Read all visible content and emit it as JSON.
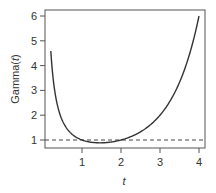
{
  "chart_data": {
    "type": "line",
    "title": "",
    "xlabel": "t",
    "ylabel": "Gamma(t)",
    "xlim": [
      0.2,
      4
    ],
    "ylim": [
      0.8,
      6.2
    ],
    "x_ticks": [
      "1",
      "2",
      "3",
      "4"
    ],
    "y_ticks": [
      "1",
      "2",
      "3",
      "4",
      "5",
      "6"
    ],
    "grid": false,
    "legend": null,
    "series": [
      {
        "name": "Gamma(t)",
        "style": "solid",
        "color": "#333333",
        "x": [
          0.2,
          0.25,
          0.3,
          0.4,
          0.5,
          0.6,
          0.7,
          0.8,
          0.9,
          1.0,
          1.2,
          1.4,
          1.46,
          1.6,
          1.8,
          2.0,
          2.2,
          2.4,
          2.6,
          2.8,
          3.0,
          3.2,
          3.4,
          3.6,
          3.8,
          4.0
        ],
        "values": [
          4.59,
          3.63,
          2.99,
          2.22,
          1.77,
          1.49,
          1.3,
          1.16,
          1.07,
          1.0,
          0.92,
          0.89,
          0.886,
          0.89,
          0.93,
          1.0,
          1.1,
          1.24,
          1.43,
          1.68,
          2.0,
          2.42,
          2.98,
          3.72,
          4.69,
          6.0
        ]
      },
      {
        "name": "reference y=1",
        "style": "dashed",
        "color": "#333333",
        "x": [
          0.2,
          4.0
        ],
        "values": [
          1,
          1
        ]
      }
    ]
  }
}
